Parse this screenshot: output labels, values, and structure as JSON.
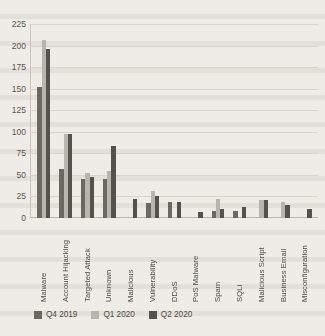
{
  "chart_data": {
    "type": "bar",
    "title": "",
    "xlabel": "",
    "ylabel": "",
    "ylim": [
      0,
      225
    ],
    "yticks": [
      0,
      25,
      50,
      75,
      100,
      125,
      150,
      175,
      200,
      225
    ],
    "grid": true,
    "legend_position": "bottom-left",
    "categories": [
      "Malware",
      "Account Hijacking",
      "Targeted Attack",
      "Unknown",
      "Malicious",
      "Vulnerability",
      "DDoS",
      "PoS Malware",
      "Spam",
      "SQLi",
      "Malicious Script",
      "Business Email",
      "Misconfiguration"
    ],
    "series": [
      {
        "name": "Q4 2019",
        "color": "#6b6862",
        "values": [
          152,
          57,
          45,
          45,
          0,
          17,
          18,
          0,
          8,
          8,
          0,
          0,
          0
        ]
      },
      {
        "name": "Q1 2020",
        "color": "#b9b5ae",
        "values": [
          207,
          98,
          52,
          55,
          0,
          31,
          0,
          0,
          22,
          0,
          21,
          19,
          0
        ]
      },
      {
        "name": "Q2 2020",
        "color": "#55524d",
        "values": [
          196,
          97,
          48,
          83,
          22,
          25,
          18,
          7,
          11,
          13,
          21,
          15,
          11
        ]
      }
    ]
  }
}
